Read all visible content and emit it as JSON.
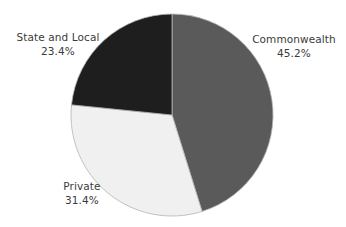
{
  "chart_data": {
    "type": "pie",
    "title": "",
    "subtitle": "",
    "xlabel": "",
    "ylabel": "",
    "legend_position": "none",
    "grid": false,
    "labels_outside": true,
    "start_angle_deg": 90,
    "direction": "clockwise",
    "categories": [
      "Commonwealth",
      "Private",
      "State and Local"
    ],
    "values": [
      45.2,
      31.4,
      23.4
    ],
    "value_suffix": "%",
    "slices": [
      {
        "name": "Commonwealth",
        "value": 45.2,
        "display_value": "45.2%",
        "color": "#5a5a5a",
        "label_text": "Commonwealth",
        "label_value_text": "45.2%"
      },
      {
        "name": "Private",
        "value": 31.4,
        "display_value": "31.4%",
        "color": "#f0f0f0",
        "label_text": "Private",
        "label_value_text": "31.4%"
      },
      {
        "name": "State and Local",
        "value": 23.4,
        "display_value": "23.4%",
        "color": "#1e1e1e",
        "label_text": "State and Local",
        "label_value_text": "23.4%"
      }
    ],
    "colors": {
      "commonwealth": "#5a5a5a",
      "private": "#f0f0f0",
      "state_and_local": "#1e1e1e",
      "background": "#ffffff",
      "label_text": "#3b3b3b",
      "slice_outline": "#b4b4b4"
    }
  },
  "geometry": {
    "center_x": 172,
    "center_y": 115,
    "radius": 101
  }
}
